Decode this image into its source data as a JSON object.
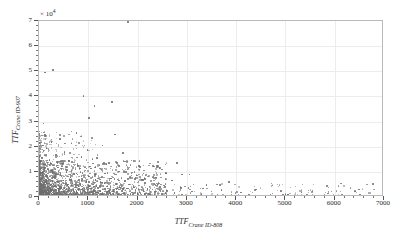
{
  "chart_data": {
    "type": "scatter",
    "title": "",
    "xlabel": "TTF",
    "xlabel_sub": "Crane ID-808",
    "ylabel": "TTF",
    "ylabel_sub": "Crane ID-907",
    "y_multiplier": "× 10",
    "y_multiplier_exp": "4",
    "xlim": [
      0,
      7000
    ],
    "ylim": [
      0,
      7
    ],
    "xticks": [
      0,
      1000,
      2000,
      3000,
      4000,
      5000,
      6000,
      7000
    ],
    "xtick_labels": [
      "0",
      "1000",
      "2000",
      "3000",
      "4000",
      "5000",
      "6000",
      "7000"
    ],
    "yticks": [
      0,
      1,
      2,
      3,
      4,
      5,
      6,
      7
    ],
    "ytick_labels": [
      "0",
      "1",
      "2",
      "3",
      "4",
      "5",
      "6",
      "7"
    ],
    "x_minor_step": 200,
    "y_minor_step": 0.2,
    "grid": true,
    "grid_color": "#ececec",
    "marker_color": "#6e6e6e",
    "marker_size": 1.6,
    "legend": "none",
    "points": [
      [
        1800,
        6.95
      ],
      [
        290,
        5.05
      ],
      [
        900,
        4.02
      ],
      [
        1480,
        3.78
      ],
      [
        1130,
        3.62
      ],
      [
        1020,
        3.15
      ],
      [
        95,
        2.92
      ],
      [
        760,
        2.55
      ],
      [
        1540,
        2.48
      ],
      [
        430,
        2.3
      ],
      [
        250,
        2.18
      ],
      [
        660,
        2.12
      ],
      [
        1290,
        2.05
      ],
      [
        150,
        1.96
      ],
      [
        980,
        1.88
      ],
      [
        520,
        1.8
      ],
      [
        1700,
        1.74
      ],
      [
        340,
        1.68
      ],
      [
        860,
        1.6
      ],
      [
        1180,
        1.54
      ],
      [
        210,
        1.48
      ],
      [
        610,
        1.42
      ],
      [
        1420,
        1.36
      ],
      [
        120,
        1.3
      ],
      [
        790,
        1.26
      ],
      [
        2050,
        1.22
      ],
      [
        390,
        1.18
      ],
      [
        1060,
        1.14
      ],
      [
        180,
        1.1
      ],
      [
        940,
        1.06
      ],
      [
        1620,
        1.02
      ],
      [
        560,
        0.99
      ],
      [
        270,
        0.96
      ],
      [
        1340,
        0.94
      ],
      [
        710,
        0.91
      ],
      [
        3050,
        0.89
      ],
      [
        440,
        0.87
      ],
      [
        1880,
        0.85
      ],
      [
        160,
        0.83
      ],
      [
        1010,
        0.81
      ],
      [
        640,
        0.79
      ],
      [
        2300,
        0.77
      ],
      [
        320,
        0.75
      ],
      [
        1460,
        0.73
      ],
      [
        880,
        0.71
      ],
      [
        200,
        0.7
      ],
      [
        1150,
        0.68
      ],
      [
        500,
        0.66
      ],
      [
        2700,
        0.65
      ],
      [
        1750,
        0.63
      ],
      [
        370,
        0.62
      ],
      [
        960,
        0.6
      ],
      [
        140,
        0.59
      ],
      [
        1280,
        0.57
      ],
      [
        680,
        0.56
      ],
      [
        2150,
        0.55
      ],
      [
        420,
        0.53
      ],
      [
        1560,
        0.52
      ],
      [
        830,
        0.51
      ],
      [
        240,
        0.5
      ],
      [
        1090,
        0.49
      ],
      [
        580,
        0.48
      ],
      [
        3400,
        0.47
      ],
      [
        1920,
        0.46
      ],
      [
        330,
        0.45
      ],
      [
        1020,
        0.44
      ],
      [
        170,
        0.43
      ],
      [
        1380,
        0.42
      ],
      [
        740,
        0.41
      ],
      [
        2450,
        0.4
      ],
      [
        460,
        0.39
      ],
      [
        1640,
        0.385
      ],
      [
        900,
        0.375
      ],
      [
        210,
        0.37
      ],
      [
        1200,
        0.36
      ],
      [
        620,
        0.355
      ],
      [
        2880,
        0.35
      ],
      [
        1790,
        0.34
      ],
      [
        390,
        0.335
      ],
      [
        1040,
        0.33
      ],
      [
        130,
        0.325
      ],
      [
        1340,
        0.32
      ],
      [
        700,
        0.315
      ],
      [
        2200,
        0.31
      ],
      [
        480,
        0.305
      ],
      [
        1520,
        0.3
      ],
      [
        860,
        0.295
      ],
      [
        260,
        0.29
      ],
      [
        1120,
        0.285
      ],
      [
        600,
        0.28
      ],
      [
        3700,
        0.275
      ],
      [
        1960,
        0.27
      ],
      [
        350,
        0.265
      ],
      [
        980,
        0.26
      ],
      [
        180,
        0.255
      ],
      [
        1420,
        0.25
      ],
      [
        760,
        0.248
      ],
      [
        2600,
        0.245
      ],
      [
        500,
        0.24
      ],
      [
        1680,
        0.238
      ],
      [
        920,
        0.235
      ],
      [
        230,
        0.23
      ],
      [
        1240,
        0.228
      ],
      [
        660,
        0.225
      ],
      [
        3100,
        0.22
      ],
      [
        1840,
        0.218
      ],
      [
        410,
        0.215
      ],
      [
        1080,
        0.21
      ],
      [
        150,
        0.208
      ],
      [
        1380,
        0.205
      ],
      [
        720,
        0.2
      ],
      [
        2350,
        0.198
      ],
      [
        520,
        0.195
      ],
      [
        1580,
        0.19
      ],
      [
        880,
        0.188
      ],
      [
        280,
        0.185
      ],
      [
        1160,
        0.18
      ],
      [
        640,
        0.178
      ],
      [
        4100,
        0.175
      ],
      [
        2000,
        0.17
      ],
      [
        370,
        0.168
      ],
      [
        1000,
        0.165
      ],
      [
        190,
        0.16
      ],
      [
        1440,
        0.158
      ],
      [
        780,
        0.155
      ],
      [
        2750,
        0.15
      ],
      [
        540,
        0.148
      ],
      [
        1700,
        0.145
      ],
      [
        940,
        0.142
      ],
      [
        250,
        0.14
      ],
      [
        1260,
        0.138
      ],
      [
        680,
        0.135
      ],
      [
        3300,
        0.13
      ],
      [
        1860,
        0.128
      ],
      [
        430,
        0.125
      ],
      [
        1100,
        0.122
      ],
      [
        160,
        0.12
      ],
      [
        1400,
        0.118
      ],
      [
        740,
        0.115
      ],
      [
        2500,
        0.112
      ],
      [
        560,
        0.11
      ],
      [
        1600,
        0.108
      ],
      [
        900,
        0.105
      ],
      [
        300,
        0.102
      ],
      [
        1180,
        0.1
      ],
      [
        660,
        0.098
      ],
      [
        4700,
        0.095
      ],
      [
        2080,
        0.092
      ],
      [
        390,
        0.09
      ],
      [
        1020,
        0.088
      ],
      [
        200,
        0.086
      ],
      [
        1460,
        0.084
      ],
      [
        800,
        0.082
      ],
      [
        2900,
        0.08
      ],
      [
        580,
        0.078
      ],
      [
        1740,
        0.076
      ],
      [
        960,
        0.074
      ],
      [
        270,
        0.072
      ],
      [
        1300,
        0.07
      ],
      [
        700,
        0.068
      ],
      [
        3600,
        0.066
      ],
      [
        1900,
        0.064
      ],
      [
        450,
        0.062
      ],
      [
        1140,
        0.06
      ],
      [
        170,
        0.058
      ],
      [
        1420,
        0.056
      ],
      [
        760,
        0.054
      ],
      [
        2400,
        0.052
      ],
      [
        600,
        0.05
      ],
      [
        1640,
        0.048
      ],
      [
        920,
        0.046
      ],
      [
        310,
        0.044
      ],
      [
        1220,
        0.042
      ],
      [
        680,
        0.04
      ],
      [
        5100,
        0.039
      ],
      [
        2120,
        0.038
      ],
      [
        400,
        0.037
      ],
      [
        1060,
        0.036
      ],
      [
        210,
        0.035
      ],
      [
        1480,
        0.034
      ],
      [
        820,
        0.033
      ],
      [
        3000,
        0.032
      ],
      [
        620,
        0.031
      ],
      [
        1780,
        0.03
      ],
      [
        980,
        0.029
      ],
      [
        290,
        0.028
      ],
      [
        1320,
        0.027
      ],
      [
        720,
        0.026
      ],
      [
        4300,
        0.025
      ],
      [
        1940,
        0.024
      ],
      [
        470,
        0.023
      ],
      [
        1160,
        0.022
      ],
      [
        180,
        0.021
      ],
      [
        1440,
        0.02
      ],
      [
        780,
        0.019
      ],
      [
        2550,
        0.018
      ],
      [
        640,
        0.017
      ],
      [
        1680,
        0.016
      ],
      [
        940,
        0.015
      ],
      [
        330,
        0.014
      ],
      [
        1240,
        0.013
      ],
      [
        700,
        0.012
      ],
      [
        5600,
        0.011
      ],
      [
        2180,
        0.0105
      ],
      [
        420,
        0.01
      ],
      [
        1080,
        0.0095
      ],
      [
        230,
        0.009
      ],
      [
        1500,
        0.0085
      ],
      [
        840,
        0.008
      ],
      [
        3200,
        0.0078
      ],
      [
        660,
        0.0075
      ],
      [
        1800,
        0.0072
      ],
      [
        1000,
        0.007
      ],
      [
        300,
        0.0068
      ],
      [
        1360,
        0.0065
      ],
      [
        740,
        0.0062
      ],
      [
        6200,
        0.006
      ],
      [
        1980,
        0.0058
      ],
      [
        490,
        0.0055
      ],
      [
        1200,
        0.0052
      ],
      [
        190,
        0.005
      ],
      [
        1460,
        0.0048
      ],
      [
        800,
        0.0045
      ],
      [
        2650,
        0.0042
      ],
      [
        680,
        0.004
      ],
      [
        1720,
        0.0038
      ],
      [
        960,
        0.0036
      ],
      [
        350,
        0.0034
      ],
      [
        1280,
        0.0032
      ],
      [
        760,
        0.003
      ],
      [
        6900,
        0.0028
      ],
      [
        2250,
        0.0026
      ],
      [
        440,
        0.0024
      ],
      [
        1120,
        0.0022
      ],
      [
        250,
        0.002
      ],
      [
        1540,
        0.0018
      ],
      [
        880,
        0.0016
      ],
      [
        3900,
        0.0014
      ],
      [
        700,
        0.0012
      ],
      [
        1860,
        0.001
      ],
      [
        5000,
        0.09
      ],
      [
        5050,
        0.085
      ],
      [
        4950,
        0.08
      ],
      [
        6550,
        0.045
      ],
      [
        2900,
        0.9
      ],
      [
        3850,
        0.6
      ],
      [
        2800,
        1.35
      ],
      [
        1950,
        0.72
      ],
      [
        4400,
        0.3
      ],
      [
        3500,
        0.22
      ],
      [
        120,
        4.95
      ],
      [
        80,
        2.05
      ],
      [
        60,
        1.55
      ],
      [
        100,
        1.15
      ],
      [
        70,
        0.92
      ],
      [
        55,
        0.7
      ],
      [
        90,
        0.58
      ],
      [
        45,
        0.44
      ],
      [
        75,
        0.36
      ],
      [
        50,
        0.27
      ],
      [
        65,
        0.2
      ],
      [
        40,
        0.15
      ],
      [
        85,
        0.11
      ],
      [
        35,
        0.08
      ],
      [
        58,
        0.055
      ],
      [
        42,
        0.035
      ],
      [
        68,
        0.022
      ],
      [
        30,
        0.014
      ],
      [
        52,
        0.009
      ],
      [
        25,
        0.005
      ]
    ]
  }
}
